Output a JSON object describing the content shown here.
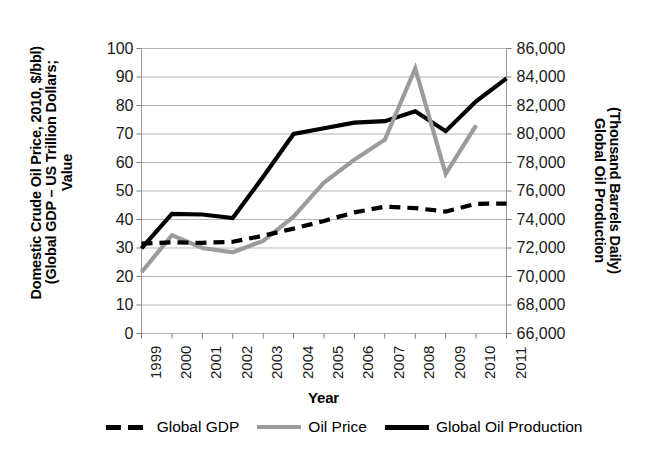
{
  "chart_data": {
    "type": "line",
    "title": "",
    "xlabel": "Year",
    "ylabel": "Value\n(Global GDP – US Trillion Dollars;\nDomestic Crude Oil Price, 2010, $/bbl)",
    "ylabel_secondary": "Global Oil Production\n(Thousand Barrels Daily)",
    "ylabel_lines": [
      "Value",
      "(Global GDP – US Trillion Dollars;",
      "Domestic Crude Oil Price, 2010, $/bbl)"
    ],
    "ylabel_secondary_lines": [
      "Global Oil Production",
      "(Thousand Barrels Daily)"
    ],
    "categories": [
      "1999",
      "2000",
      "2001",
      "2002",
      "2003",
      "2004",
      "2005",
      "2006",
      "2007",
      "2008",
      "2009",
      "2010",
      "2011"
    ],
    "x": [
      1999,
      2000,
      2001,
      2002,
      2003,
      2004,
      2005,
      2006,
      2007,
      2008,
      2009,
      2010,
      2011
    ],
    "ylim": [
      0,
      100
    ],
    "ytick_step": 10,
    "yticks": [
      "100",
      "90",
      "80",
      "70",
      "60",
      "50",
      "40",
      "30",
      "20",
      "10",
      "0"
    ],
    "ylim_secondary": [
      66000,
      86000
    ],
    "ytick_step_secondary": 2000,
    "yticks_secondary": [
      "86,000",
      "84,000",
      "82,000",
      "80,000",
      "78,000",
      "76,000",
      "74,000",
      "72,000",
      "70,000",
      "68,000",
      "66,000"
    ],
    "grid": true,
    "legend_position": "bottom",
    "series": [
      {
        "name": "Global GDP",
        "axis": "left",
        "style": "dashed",
        "color": "#000000",
        "values": [
          31.5,
          32.0,
          31.8,
          32.2,
          34.3,
          36.8,
          39.5,
          42.5,
          44.5,
          44.0,
          42.8,
          45.5,
          45.6
        ]
      },
      {
        "name": "Oil Price",
        "axis": "left",
        "style": "solid",
        "color": "#9b9b9b",
        "values": [
          21.5,
          34.5,
          30.0,
          28.5,
          32.5,
          41.0,
          53.0,
          61.0,
          68.0,
          93.0,
          56.0,
          73.0,
          null
        ]
      },
      {
        "name": "Global Oil Production",
        "axis": "right",
        "style": "solid",
        "color": "#000000",
        "values": [
          71970,
          74400,
          74350,
          74100,
          77000,
          80000,
          80400,
          80800,
          80900,
          81600,
          80200,
          82300,
          83900
        ]
      }
    ],
    "series_secondary_left_equivalent": {
      "note": "Global Oil Production plotted on right axis; left-axis equivalent heights",
      "values": [
        31.5,
        44.0,
        43.8,
        42.8,
        74.5,
        74.5,
        77.0,
        78.5,
        79.8,
        81.5,
        74.8,
        84.0,
        89.0
      ]
    }
  },
  "legend": {
    "items": [
      {
        "label": "Global GDP",
        "swatch": "dashed-black-line"
      },
      {
        "label": "Oil Price",
        "swatch": "solid-gray-line"
      },
      {
        "label": "Global Oil Production",
        "swatch": "solid-black-line"
      }
    ]
  },
  "colors": {
    "gdp": "#000000",
    "oil_price": "#9b9b9b",
    "oil_production": "#000000",
    "grid": "#b4b4b4",
    "axis": "#9a9a9a",
    "text": "#000000",
    "background": "#ffffff"
  }
}
